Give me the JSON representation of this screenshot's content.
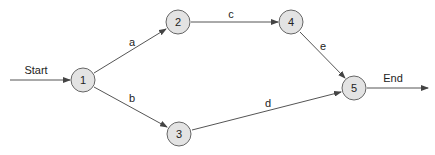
{
  "diagram": {
    "type": "network",
    "start_label": "Start",
    "end_label": "End",
    "nodes": [
      {
        "id": "1",
        "label": "1",
        "x": 83,
        "y": 80
      },
      {
        "id": "2",
        "label": "2",
        "x": 178,
        "y": 22
      },
      {
        "id": "3",
        "label": "3",
        "x": 179,
        "y": 134
      },
      {
        "id": "4",
        "label": "4",
        "x": 291,
        "y": 22
      },
      {
        "id": "5",
        "label": "5",
        "x": 354,
        "y": 88
      }
    ],
    "edges": [
      {
        "from": "1",
        "to": "2",
        "label": "a"
      },
      {
        "from": "1",
        "to": "3",
        "label": "b"
      },
      {
        "from": "2",
        "to": "4",
        "label": "c"
      },
      {
        "from": "3",
        "to": "5",
        "label": "d"
      },
      {
        "from": "4",
        "to": "5",
        "label": "e"
      }
    ],
    "colors": {
      "node_fill": "#e3e3e3",
      "node_stroke": "#666666",
      "edge": "#555555"
    }
  }
}
